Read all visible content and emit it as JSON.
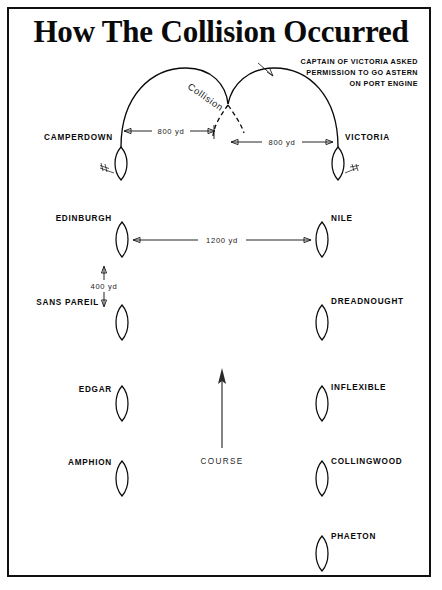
{
  "title": "How The Collision Occurred",
  "annotation": {
    "lines": [
      "CAPTAIN OF VICTORIA ASKED",
      "PERMISSION TO GO ASTERN",
      "ON PORT ENGINE"
    ]
  },
  "collision_label": "Collision",
  "course_label": "COURSE",
  "dimensions": {
    "turn_left": "800 yd",
    "turn_right": "800 yd",
    "columns_apart": "1200 yd",
    "line_spacing": "400 yd"
  },
  "ships": {
    "camperdown": "CAMPERDOWN",
    "victoria": "VICTORIA",
    "edinburgh": "EDINBURGH",
    "nile": "NILE",
    "sans_pareil": "SANS PAREIL",
    "dreadnought": "DREADNOUGHT",
    "edgar": "EDGAR",
    "inflexible": "INFLEXIBLE",
    "amphion": "AMPHION",
    "collingwood": "COLLINGWOOD",
    "phaeton": "PHAETON"
  },
  "colors": {
    "ink": "#0a0a0a",
    "paper": "#ffffff",
    "rule": "#111111"
  },
  "diagram_data": {
    "type": "diagram",
    "subject": "HMS Victoria and HMS Camperdown collision, 22 June 1893",
    "columns": [
      {
        "name": "port-column",
        "lead": "CAMPERDOWN",
        "order": [
          "CAMPERDOWN",
          "EDINBURGH",
          "SANS PAREIL",
          "EDGAR",
          "AMPHION"
        ]
      },
      {
        "name": "starboard-column",
        "lead": "VICTORIA",
        "order": [
          "VICTORIA",
          "NILE",
          "DREADNOUGHT",
          "INFLEXIBLE",
          "COLLINGWOOD",
          "PHAETON"
        ]
      }
    ],
    "turning_circles": [
      {
        "ship": "CAMPERDOWN",
        "turn_radius_label": "800 yd",
        "direction": "starboard"
      },
      {
        "ship": "VICTORIA",
        "turn_radius_label": "800 yd",
        "direction": "port"
      }
    ],
    "column_separation": "1200 yd",
    "ship_separation_in_column": "400 yd",
    "course_direction": "north (up)"
  }
}
